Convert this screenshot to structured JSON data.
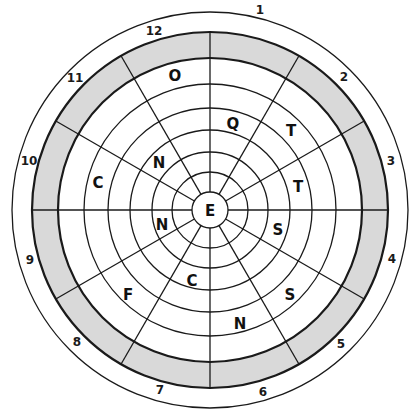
{
  "puzzle": {
    "type": "circular-letter-grid",
    "center_letter": "E",
    "sector_count": 12,
    "colors": {
      "band_fill": "#d9d9d9",
      "line": "#1a1a1a",
      "background": "#ffffff"
    },
    "clock_numbers": [
      "1",
      "2",
      "3",
      "4",
      "5",
      "6",
      "7",
      "8",
      "9",
      "10",
      "11",
      "12"
    ],
    "letters": [
      {
        "sector": 12,
        "letter": "O"
      },
      {
        "sector": 1,
        "letter": "Q"
      },
      {
        "sector": 2,
        "letter": "T"
      },
      {
        "sector": 3,
        "letter": "T"
      },
      {
        "sector": 4,
        "letter": "S"
      },
      {
        "sector": 5,
        "letter": "S"
      },
      {
        "sector": 6,
        "letter": "N"
      },
      {
        "sector": 7,
        "letter": "C"
      },
      {
        "sector": 8,
        "letter": "F"
      },
      {
        "sector": 9,
        "letter": "N"
      },
      {
        "sector": 10,
        "letter": "C"
      },
      {
        "sector": 11,
        "letter": "N"
      }
    ]
  }
}
